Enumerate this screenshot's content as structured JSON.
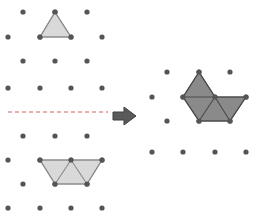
{
  "figure": {
    "type": "puzzle-transformation-diagram",
    "width": 261,
    "height": 216,
    "background_color": "#ffffff",
    "colors": {
      "dot_color": "#555559",
      "light_fill": "#d9d9d9",
      "light_stroke": "#8c8c8c",
      "dark_fill": "#8a8a8a",
      "dark_stroke": "#4a4a4a",
      "dashed_line": "#d06060",
      "arrow_fill": "#5a5a5a",
      "arrow_stroke": "#3f3f3f"
    },
    "dot_radius": 2.6,
    "lattice": {
      "columns_spacing": 31.5,
      "rows_spacing": 24,
      "stagger": 15.75
    }
  },
  "left_panel": {
    "name": "left-lattice",
    "dots": [
      {
        "x": 23,
        "y": 12
      },
      {
        "x": 55,
        "y": 12
      },
      {
        "x": 87,
        "y": 12
      },
      {
        "x": 8,
        "y": 37
      },
      {
        "x": 40,
        "y": 37
      },
      {
        "x": 71,
        "y": 37
      },
      {
        "x": 102,
        "y": 37
      },
      {
        "x": 23,
        "y": 61
      },
      {
        "x": 55,
        "y": 61
      },
      {
        "x": 87,
        "y": 61
      },
      {
        "x": 8,
        "y": 88
      },
      {
        "x": 40,
        "y": 88
      },
      {
        "x": 71,
        "y": 88
      },
      {
        "x": 102,
        "y": 88
      },
      {
        "x": 23,
        "y": 136
      },
      {
        "x": 55,
        "y": 136
      },
      {
        "x": 87,
        "y": 136
      },
      {
        "x": 8,
        "y": 160
      },
      {
        "x": 40,
        "y": 160
      },
      {
        "x": 71,
        "y": 160
      },
      {
        "x": 102,
        "y": 160
      },
      {
        "x": 23,
        "y": 184
      },
      {
        "x": 55,
        "y": 184
      },
      {
        "x": 87,
        "y": 184
      },
      {
        "x": 8,
        "y": 208
      },
      {
        "x": 40,
        "y": 208
      },
      {
        "x": 71,
        "y": 208
      },
      {
        "x": 102,
        "y": 208
      }
    ],
    "shape_top": {
      "name": "light-triangle-piece",
      "triangle_count": 1,
      "outline": "55,12 71,37 40,37",
      "edges": [
        "55,12 71,37",
        "71,37 40,37",
        "40,37 55,12"
      ],
      "vertices": [
        {
          "x": 55,
          "y": 12
        },
        {
          "x": 71,
          "y": 37
        },
        {
          "x": 40,
          "y": 37
        }
      ]
    },
    "shape_bottom": {
      "name": "light-trapezoid-piece",
      "triangle_count": 3,
      "outline": "40,160 102,160 87,184 55,184",
      "edges": [
        "40,160 102,160",
        "102,160 87,184",
        "87,184 55,184",
        "55,184 40,160",
        "55,184 71,160",
        "87,184 71,160"
      ],
      "vertices": [
        {
          "x": 40,
          "y": 160
        },
        {
          "x": 71,
          "y": 160
        },
        {
          "x": 102,
          "y": 160
        },
        {
          "x": 55,
          "y": 184
        },
        {
          "x": 87,
          "y": 184
        }
      ]
    },
    "mirror_line": {
      "name": "dashed-mirror-line",
      "x1": 8,
      "y1": 112,
      "x2": 108,
      "y2": 112,
      "dash_pattern": "4,3",
      "style": "dashed"
    }
  },
  "arrow": {
    "name": "transform-arrow",
    "direction": "right",
    "x": 113,
    "y": 107,
    "width": 23,
    "height": 18,
    "path": "113,112 124,112 124,107 136,116 124,125 124,120 113,120"
  },
  "right_panel": {
    "name": "right-lattice",
    "dots": [
      {
        "x": 167,
        "y": 72
      },
      {
        "x": 199,
        "y": 72
      },
      {
        "x": 230,
        "y": 72
      },
      {
        "x": 152,
        "y": 97
      },
      {
        "x": 183,
        "y": 97
      },
      {
        "x": 215,
        "y": 97
      },
      {
        "x": 246,
        "y": 97
      },
      {
        "x": 167,
        "y": 121
      },
      {
        "x": 199,
        "y": 121
      },
      {
        "x": 230,
        "y": 121
      },
      {
        "x": 152,
        "y": 152
      },
      {
        "x": 183,
        "y": 152
      },
      {
        "x": 215,
        "y": 152
      },
      {
        "x": 246,
        "y": 152
      }
    ],
    "shape": {
      "name": "dark-combined-piece",
      "triangle_count": 4,
      "outline": "199,72 215,97 246,97 230,121 199,121 183,97",
      "edges": [
        "199,72 215,97",
        "215,97 246,97",
        "246,97 230,121",
        "230,121 199,121",
        "199,121 183,97",
        "183,97 199,72",
        "183,97 215,97",
        "199,121 215,97",
        "230,121 215,97"
      ],
      "vertices": [
        {
          "x": 199,
          "y": 72
        },
        {
          "x": 183,
          "y": 97
        },
        {
          "x": 215,
          "y": 97
        },
        {
          "x": 246,
          "y": 97
        },
        {
          "x": 199,
          "y": 121
        },
        {
          "x": 230,
          "y": 121
        }
      ]
    }
  }
}
